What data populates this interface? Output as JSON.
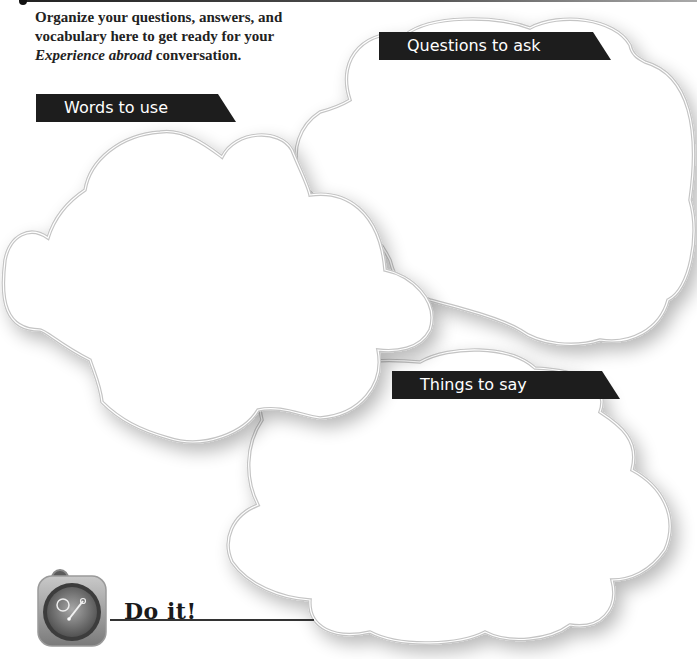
{
  "intro": {
    "line1": "Organize your questions, answers, and",
    "line2": "vocabulary here to get ready for your",
    "italic": "Experience abroad",
    "rest": " conversation."
  },
  "clouds": [
    {
      "id": "questions",
      "label": "Questions to ask"
    },
    {
      "id": "words",
      "label": "Words to use"
    },
    {
      "id": "things",
      "label": "Things to say"
    }
  ],
  "footer": {
    "icon": "stopwatch-icon",
    "label": "Do it!"
  },
  "colors": {
    "label_bg": "#1d1d1d",
    "label_text": "#ffffff",
    "cloud_outline": "#c4c4c4",
    "text": "#222222"
  }
}
